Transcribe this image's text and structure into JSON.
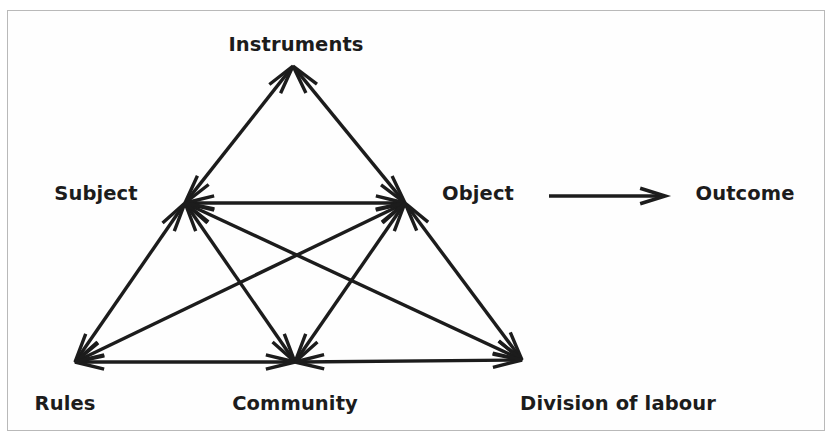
{
  "diagram": {
    "stroke_color": "#1c1c1c",
    "text_color": "#1c1c1c",
    "background_color": "#ffffff",
    "border_color": "#b9b9b9",
    "nodes": [
      {
        "id": "instruments",
        "label": "Instruments",
        "x": 296,
        "y": 45,
        "anchor_x": 293,
        "anchor_y": 66
      },
      {
        "id": "subject",
        "label": "Subject",
        "x": 96,
        "y": 194,
        "anchor_x": 185,
        "anchor_y": 203
      },
      {
        "id": "object",
        "label": "Object",
        "x": 478,
        "y": 194,
        "anchor_x": 405,
        "anchor_y": 203
      },
      {
        "id": "outcome",
        "label": "Outcome",
        "x": 745,
        "y": 194,
        "anchor_x": 745,
        "anchor_y": 194
      },
      {
        "id": "rules",
        "label": "Rules",
        "x": 65,
        "y": 404,
        "anchor_x": 75,
        "anchor_y": 362
      },
      {
        "id": "community",
        "label": "Community",
        "x": 295,
        "y": 404,
        "anchor_x": 295,
        "anchor_y": 362
      },
      {
        "id": "division",
        "label": "Division of labour",
        "x": 618,
        "y": 404,
        "anchor_x": 522,
        "anchor_y": 360
      }
    ],
    "edges": [
      {
        "from": "subject",
        "to": "instruments",
        "arrows": "both"
      },
      {
        "from": "instruments",
        "to": "object",
        "arrows": "both"
      },
      {
        "from": "subject",
        "to": "object",
        "arrows": "both"
      },
      {
        "from": "subject",
        "to": "rules",
        "arrows": "both"
      },
      {
        "from": "subject",
        "to": "community",
        "arrows": "both"
      },
      {
        "from": "subject",
        "to": "division",
        "arrows": "both"
      },
      {
        "from": "object",
        "to": "rules",
        "arrows": "both"
      },
      {
        "from": "object",
        "to": "community",
        "arrows": "both"
      },
      {
        "from": "object",
        "to": "division",
        "arrows": "both"
      },
      {
        "from": "rules",
        "to": "community",
        "arrows": "both"
      },
      {
        "from": "community",
        "to": "division",
        "arrows": "both"
      },
      {
        "from": "object",
        "to": "outcome",
        "arrows": "forward",
        "style": "outcome"
      }
    ]
  }
}
